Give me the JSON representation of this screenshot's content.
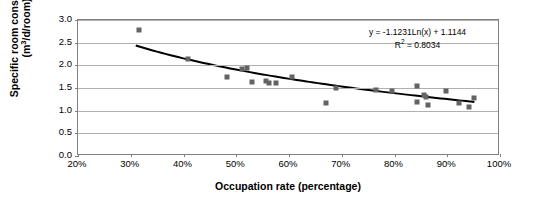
{
  "chart_data": {
    "type": "scatter",
    "title": "",
    "xlabel": "Occupation rate (percentage)",
    "ylabel_line1": "Specific room consumption",
    "ylabel_line2_pre": "(m",
    "ylabel_line2_sup": "3",
    "ylabel_line2_post": "/d/room)",
    "xlim": [
      20,
      100
    ],
    "ylim": [
      0.0,
      3.0
    ],
    "xticks": [
      "20%",
      "30%",
      "40%",
      "50%",
      "60%",
      "70%",
      "80%",
      "90%",
      "100%"
    ],
    "xtick_values": [
      20,
      30,
      40,
      50,
      60,
      70,
      80,
      90,
      100
    ],
    "yticks": [
      "0.0",
      "0.5",
      "1.0",
      "1.5",
      "2.0",
      "2.5",
      "3.0"
    ],
    "ytick_values": [
      0.0,
      0.5,
      1.0,
      1.5,
      2.0,
      2.5,
      3.0
    ],
    "grid": "horizontal",
    "legend": "none",
    "marker_color": "#636363",
    "trendline_color": "#000000",
    "gridline_color": "#b0b0b0",
    "axis_color": "#808080",
    "annotations": {
      "equation": "y = -1.1231Ln(x) + 1.1144",
      "r_squared_pre": "R",
      "r_squared_sup": "2",
      "r_squared_post": " = 0.8034"
    },
    "trendline": {
      "form": "y = -1.1231*Ln(x) + 1.1144",
      "slope_coefficient": -1.1231,
      "intercept": 1.1144,
      "r_squared": 0.8034,
      "x_start": 31.0,
      "x_end": 95.5
    },
    "points": [
      {
        "x": 31.5,
        "y": 2.78
      },
      {
        "x": 40.8,
        "y": 2.13
      },
      {
        "x": 48.2,
        "y": 1.75
      },
      {
        "x": 51.0,
        "y": 1.93
      },
      {
        "x": 52.1,
        "y": 1.94
      },
      {
        "x": 53.0,
        "y": 1.63
      },
      {
        "x": 55.6,
        "y": 1.66
      },
      {
        "x": 56.2,
        "y": 1.62
      },
      {
        "x": 57.6,
        "y": 1.6
      },
      {
        "x": 60.5,
        "y": 1.74
      },
      {
        "x": 67.0,
        "y": 1.16
      },
      {
        "x": 69.0,
        "y": 1.49
      },
      {
        "x": 76.5,
        "y": 1.46
      },
      {
        "x": 79.6,
        "y": 1.44
      },
      {
        "x": 84.2,
        "y": 1.55
      },
      {
        "x": 84.3,
        "y": 1.2
      },
      {
        "x": 85.6,
        "y": 1.34
      },
      {
        "x": 86.0,
        "y": 1.31
      },
      {
        "x": 86.4,
        "y": 1.13
      },
      {
        "x": 89.7,
        "y": 1.44
      },
      {
        "x": 92.3,
        "y": 1.17
      },
      {
        "x": 94.2,
        "y": 1.09
      },
      {
        "x": 95.1,
        "y": 1.27
      }
    ]
  }
}
